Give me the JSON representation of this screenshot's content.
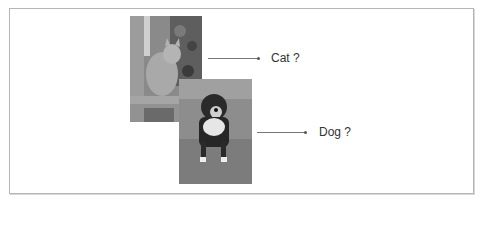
{
  "figure": {
    "items": [
      {
        "subject": "cat",
        "label": "Cat ?"
      },
      {
        "subject": "dog",
        "label": "Dog ?"
      }
    ],
    "colors": {
      "frame_border": "#b5b5b5",
      "arrow": "#777777",
      "text": "#333333"
    }
  }
}
